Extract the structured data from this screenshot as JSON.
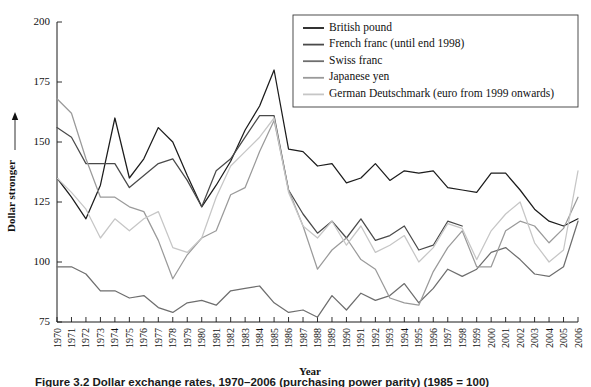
{
  "figure": {
    "caption": "Figure 3.2  Dollar exchange rates, 1970–2006 (purchasing power parity) (1985 = 100)",
    "background": "#ffffff"
  },
  "axes": {
    "y_axis_title": "Dollar stronger",
    "y_axis_arrow": "arrow-up",
    "x_axis_title": "Year",
    "y_ticks": [
      75,
      100,
      125,
      150,
      175,
      200
    ],
    "ylim": [
      75,
      200
    ],
    "x_ticks": [
      "1970",
      "1971",
      "1972",
      "1973",
      "1974",
      "1975",
      "1976",
      "1977",
      "1978",
      "1979",
      "1980",
      "1981",
      "1982",
      "1983",
      "1984",
      "1985",
      "1986",
      "1987",
      "1988",
      "1989",
      "1990",
      "1991",
      "1992",
      "1993",
      "1994",
      "1995",
      "1996",
      "1997",
      "1998",
      "1999",
      "2000",
      "2001",
      "2002",
      "2003",
      "2004",
      "2005",
      "2006"
    ],
    "grid": false
  },
  "legend": {
    "position": "top-right",
    "entries": [
      {
        "label": "British pound",
        "color": "#1c1c1c"
      },
      {
        "label": "French franc (until end 1998)",
        "color": "#4a4a4a"
      },
      {
        "label": "Swiss franc",
        "color": "#6e6e6e"
      },
      {
        "label": "Japanese yen",
        "color": "#9a9a9a"
      },
      {
        "label": "German Deutschmark (euro from 1999 onwards)",
        "color": "#c6c6c6"
      }
    ]
  },
  "chart_data": {
    "type": "line",
    "title": "",
    "xlabel": "Year",
    "ylabel": "Dollar stronger",
    "ylim": [
      75,
      200
    ],
    "xlim": [
      "1970",
      "2006"
    ],
    "grid": false,
    "legend_position": "top-right",
    "x": [
      1970,
      1971,
      1972,
      1973,
      1974,
      1975,
      1976,
      1977,
      1978,
      1979,
      1980,
      1981,
      1982,
      1983,
      1984,
      1985,
      1986,
      1987,
      1988,
      1989,
      1990,
      1991,
      1992,
      1993,
      1994,
      1995,
      1996,
      1997,
      1998,
      1999,
      2000,
      2001,
      2002,
      2003,
      2004,
      2005,
      2006
    ],
    "series": [
      {
        "name": "British pound",
        "color": "#1c1c1c",
        "values": [
          135,
          127,
          118,
          132,
          160,
          135,
          143,
          156,
          150,
          136,
          123,
          132,
          142,
          155,
          165,
          180,
          147,
          146,
          140,
          141,
          133,
          135,
          141,
          134,
          138,
          137,
          138,
          131,
          130,
          129,
          137,
          137,
          130,
          122,
          117,
          115,
          118
        ]
      },
      {
        "name": "French franc (until end 1998)",
        "color": "#4a4a4a",
        "values": [
          156,
          152,
          141,
          141,
          141,
          131,
          136,
          141,
          143,
          134,
          123,
          138,
          143,
          152,
          161,
          161,
          130,
          120,
          112,
          117,
          110,
          118,
          109,
          111,
          115,
          105,
          107,
          117,
          115,
          null,
          null,
          null,
          null,
          null,
          null,
          null,
          null
        ]
      },
      {
        "name": "Swiss franc",
        "color": "#6e6e6e",
        "values": [
          98,
          98,
          95,
          88,
          88,
          85,
          86,
          81,
          79,
          83,
          84,
          82,
          88,
          89,
          90,
          83,
          79,
          80,
          77,
          86,
          80,
          87,
          84,
          86,
          91,
          83,
          89,
          97,
          94,
          97,
          104,
          106,
          101,
          95,
          94,
          98,
          117
        ]
      },
      {
        "name": "Japanese yen",
        "color": "#9a9a9a",
        "values": [
          168,
          162,
          143,
          127,
          127,
          123,
          121,
          109,
          93,
          103,
          110,
          113,
          128,
          131,
          146,
          159,
          130,
          115,
          97,
          105,
          110,
          101,
          97,
          85,
          83,
          82,
          96,
          106,
          113,
          98,
          98,
          113,
          117,
          115,
          108,
          114,
          127
        ]
      },
      {
        "name": "German Deutschmark (euro from 1999 onwards)",
        "color": "#c6c6c6",
        "values": [
          135,
          129,
          122,
          110,
          118,
          113,
          118,
          121,
          106,
          104,
          110,
          127,
          140,
          146,
          152,
          160,
          129,
          115,
          110,
          117,
          107,
          115,
          104,
          107,
          111,
          100,
          106,
          116,
          114,
          101,
          113,
          120,
          125,
          108,
          100,
          105,
          138
        ]
      }
    ]
  }
}
